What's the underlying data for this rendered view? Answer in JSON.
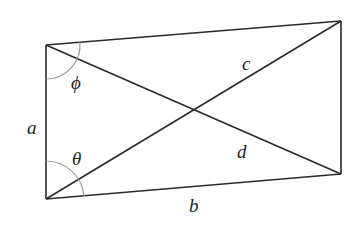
{
  "diagram": {
    "type": "quadrilateral-with-diagonals",
    "colors": {
      "line": "#2a2a2a",
      "arc": "#999999",
      "text": "#222222"
    },
    "vertices": {
      "top_left": [
        46,
        45
      ],
      "bottom_left": [
        46,
        199
      ],
      "top_right": [
        341,
        21
      ],
      "bottom_right": [
        341,
        174
      ]
    },
    "labels": {
      "side_a": "a",
      "side_b": "b",
      "diagonal_c": "c",
      "diagonal_d": "d",
      "angle_phi": "ϕ",
      "angle_theta": "θ"
    }
  }
}
